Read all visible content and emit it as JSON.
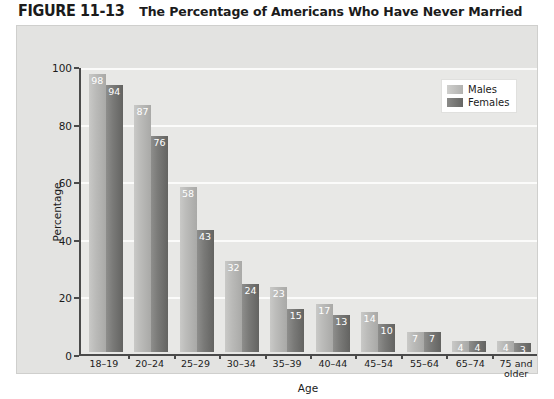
{
  "figure": {
    "number": "FIGURE 11-13",
    "title": "The Percentage of Americans Who Have Never Married",
    "source_note": ""
  },
  "legend": {
    "position": "top-right",
    "items": [
      {
        "label": "Males",
        "color": "#bcbcba"
      },
      {
        "label": "Females",
        "color": "#7a7a78"
      }
    ]
  },
  "axes": {
    "y_title": "Percentage",
    "x_title": "Age",
    "y_ticks": [
      "0",
      "20",
      "40",
      "60",
      "80",
      "100"
    ]
  },
  "chart_data": {
    "type": "bar",
    "title": "The Percentage of Americans Who Have Never Married",
    "xlabel": "Age",
    "ylabel": "Percentage",
    "ylim": [
      0,
      100
    ],
    "ytick_step": 20,
    "grid": true,
    "legend_position": "top-right",
    "categories": [
      "18–19",
      "20–24",
      "25–29",
      "30–34",
      "35–39",
      "40–44",
      "45–54",
      "55–64",
      "65–74",
      "75 and\nolder"
    ],
    "series": [
      {
        "name": "Males",
        "color": "#bcbcba",
        "values": [
          98,
          87,
          58,
          32,
          23,
          17,
          14,
          7,
          4,
          4
        ]
      },
      {
        "name": "Females",
        "color": "#7a7a78",
        "values": [
          94,
          76,
          43,
          24,
          15,
          13,
          10,
          7,
          4,
          3
        ]
      }
    ]
  }
}
